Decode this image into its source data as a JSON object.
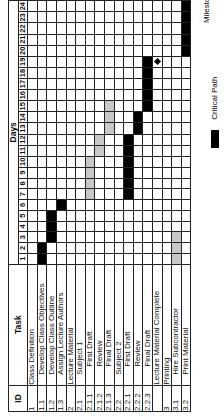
{
  "chart_data": {
    "type": "table",
    "subtype": "gantt",
    "orientation": "rotated -90deg",
    "headers": {
      "id": "ID",
      "task": "Task",
      "days": "Days"
    },
    "days": [
      1,
      2,
      3,
      4,
      5,
      6,
      7,
      8,
      9,
      10,
      11,
      12,
      13,
      14,
      15,
      16,
      17,
      18,
      19,
      20,
      21,
      22,
      23,
      24
    ],
    "rows": [
      {
        "id": "1",
        "task": "Class Definition",
        "indent": 0,
        "bars": []
      },
      {
        "id": "1.1",
        "task": "Develop Class Objectives",
        "indent": 1,
        "bars": [
          {
            "start": 1,
            "end": 2,
            "type": "critical"
          }
        ]
      },
      {
        "id": "1.2",
        "task": "Develop Class Outline",
        "indent": 1,
        "bars": [
          {
            "start": 3,
            "end": 5,
            "type": "critical"
          }
        ]
      },
      {
        "id": "1.3",
        "task": "Assign Lecture Authors",
        "indent": 1,
        "bars": [
          {
            "start": 6,
            "end": 6,
            "type": "critical"
          }
        ]
      },
      {
        "id": "2",
        "task": "Lecture Material",
        "indent": 0,
        "bars": []
      },
      {
        "id": "2.1",
        "task": "Subject 1",
        "indent": 1,
        "bars": []
      },
      {
        "id": "2.1.1",
        "task": "First Draft",
        "indent": 2,
        "bars": [
          {
            "start": 7,
            "end": 10,
            "type": "noncritical"
          }
        ]
      },
      {
        "id": "2.1.2",
        "task": "Review",
        "indent": 2,
        "bars": [
          {
            "start": 11,
            "end": 12,
            "type": "noncritical"
          }
        ]
      },
      {
        "id": "2.1.3",
        "task": "Final Draft",
        "indent": 2,
        "bars": [
          {
            "start": 13,
            "end": 15,
            "type": "noncritical"
          }
        ]
      },
      {
        "id": "2.2",
        "task": "Subject 2",
        "indent": 1,
        "bars": []
      },
      {
        "id": "2.2.1",
        "task": "First Draft",
        "indent": 2,
        "bars": [
          {
            "start": 7,
            "end": 12,
            "type": "critical"
          }
        ]
      },
      {
        "id": "2.2.2",
        "task": "Review",
        "indent": 2,
        "bars": [
          {
            "start": 13,
            "end": 14,
            "type": "critical"
          }
        ]
      },
      {
        "id": "2.2.3",
        "task": "Final Draft",
        "indent": 2,
        "bars": [
          {
            "start": 15,
            "end": 19,
            "type": "critical"
          }
        ]
      },
      {
        "id": "",
        "task": "Lecture Material Complete",
        "indent": 0,
        "milestone": 19,
        "bars": []
      },
      {
        "id": "3",
        "task": "Printing",
        "indent": 0,
        "bars": []
      },
      {
        "id": "3.1",
        "task": "Hire Subcontractor",
        "indent": 1,
        "bars": [
          {
            "start": 1,
            "end": 3,
            "type": "noncritical"
          }
        ]
      },
      {
        "id": "3.2",
        "task": "Print Material",
        "indent": 1,
        "bars": [
          {
            "start": 20,
            "end": 24,
            "type": "critical"
          }
        ]
      }
    ],
    "legend": [
      {
        "label": "Critical Path",
        "color": "#000000"
      },
      {
        "label": "Milestone",
        "symbol": "diamond"
      }
    ],
    "colors": {
      "critical": "#000000",
      "noncritical": "#c8c8c8",
      "grid": "#222222"
    }
  },
  "labels": {
    "critical_path": "Critical Path",
    "milestone": "Milestone"
  }
}
